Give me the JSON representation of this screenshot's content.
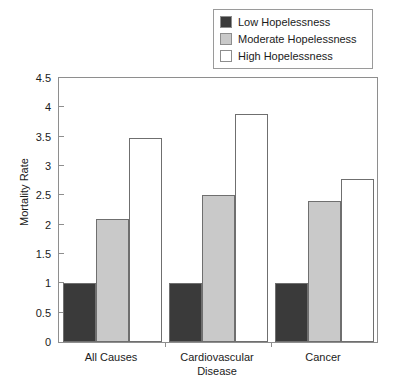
{
  "chart_data": {
    "type": "bar",
    "title": "",
    "xlabel": "",
    "ylabel": "Mortality Rate",
    "categories": [
      "All Causes",
      "Cardiovascular Disease",
      "Cancer"
    ],
    "category_lines": [
      [
        "All Causes"
      ],
      [
        "Cardiovascular",
        "Disease"
      ],
      [
        "Cancer"
      ]
    ],
    "series": [
      {
        "name": "Low Hopelessness",
        "color": "#3a3a3a",
        "values": [
          1.0,
          1.0,
          1.0
        ]
      },
      {
        "name": "Moderate Hopelessness",
        "color": "#c9c9c9",
        "values": [
          2.1,
          2.5,
          2.4
        ]
      },
      {
        "name": "High Hopelessness",
        "color": "#ffffff",
        "values": [
          3.48,
          3.88,
          2.78
        ]
      }
    ],
    "ylim": [
      0,
      4.5
    ],
    "yticks": [
      0,
      0.5,
      1,
      1.5,
      2,
      2.5,
      3,
      3.5,
      4,
      4.5
    ],
    "ytick_labels": [
      "0",
      "0.5",
      "1",
      "1.5",
      "2",
      "2.5",
      "3",
      "3.5",
      "4",
      "4.5"
    ],
    "grid": false,
    "legend_position": "top-right"
  },
  "legend": {
    "items": [
      {
        "label": "Low Hopelessness",
        "color": "#3a3a3a"
      },
      {
        "label": "Moderate Hopelessness",
        "color": "#c9c9c9"
      },
      {
        "label": "High Hopelessness",
        "color": "#ffffff"
      }
    ]
  },
  "axes": {
    "y_title": "Mortality Rate"
  }
}
